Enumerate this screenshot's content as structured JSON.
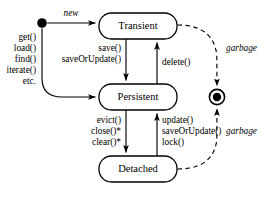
{
  "diagram": {
    "type": "uml-state-diagram",
    "background_color": "#ffffff",
    "line_color": "#000000",
    "width": 273,
    "height": 198
  },
  "states": [
    {
      "id": "transient",
      "label": "Transient",
      "x": 99,
      "y": 13,
      "w": 78,
      "h": 26
    },
    {
      "id": "persistent",
      "label": "Persistent",
      "x": 99,
      "y": 84,
      "w": 78,
      "h": 26
    },
    {
      "id": "detached",
      "label": "Detached",
      "x": 99,
      "y": 156,
      "w": 78,
      "h": 26
    }
  ],
  "pseudostates": {
    "initial": {
      "id": "initial-state",
      "cx": 42,
      "cy": 23,
      "r": 4.8
    },
    "final": {
      "id": "final-state",
      "cx": 217,
      "cy": 97,
      "outer_r": 7.6,
      "inner_r": 4.2
    }
  },
  "transitions": [
    {
      "id": "initial-to-transient",
      "from": "initial",
      "to": "transient",
      "style": "solid",
      "labels": [
        "new"
      ],
      "italic": true
    },
    {
      "id": "initial-to-persistent",
      "from": "initial",
      "to": "persistent",
      "style": "solid",
      "labels": [
        "get()",
        "load()",
        "find()",
        "iterate()",
        "etc."
      ],
      "italic": false
    },
    {
      "id": "transient-to-persistent",
      "from": "transient",
      "to": "persistent",
      "style": "solid",
      "labels": [
        "save()",
        "saveOrUpdate()"
      ],
      "italic": false
    },
    {
      "id": "persistent-to-transient",
      "from": "persistent",
      "to": "transient",
      "style": "solid",
      "labels": [
        "delete()"
      ],
      "italic": false
    },
    {
      "id": "persistent-to-detached",
      "from": "persistent",
      "to": "detached",
      "style": "solid",
      "labels": [
        "evict()",
        "close()*",
        "clear()*"
      ],
      "italic": false
    },
    {
      "id": "detached-to-persistent",
      "from": "detached",
      "to": "persistent",
      "style": "solid",
      "labels": [
        "update()",
        "saveOrUpdate()",
        "lock()"
      ],
      "italic": false
    },
    {
      "id": "transient-to-final",
      "from": "transient",
      "to": "final",
      "style": "dashed",
      "labels": [
        "garbage"
      ],
      "italic": true
    },
    {
      "id": "detached-to-final",
      "from": "detached",
      "to": "final",
      "style": "dashed",
      "labels": [
        "garbage"
      ],
      "italic": true
    }
  ],
  "labels": {
    "new": "new",
    "get": "get()",
    "load": "load()",
    "find": "find()",
    "iterate": "iterate()",
    "etc": "etc.",
    "save": "save()",
    "saveOrUpdate_down": "saveOrUpdate()",
    "delete": "delete()",
    "evict": "evict()",
    "close": "close()*",
    "clear": "clear()*",
    "update": "update()",
    "saveOrUpdate_up": "saveOrUpdate()",
    "lock": "lock()",
    "garbage_top": "garbage",
    "garbage_bottom": "garbage",
    "state_transient": "Transient",
    "state_persistent": "Persistent",
    "state_detached": "Detached"
  }
}
